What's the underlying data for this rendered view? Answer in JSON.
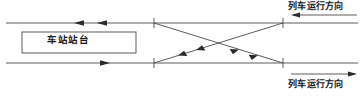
{
  "diagram": {
    "colors": {
      "line": "#4a4a4a",
      "text": "#1a1a1a",
      "background": "#ffffff"
    },
    "platform": {
      "label": "车站站台",
      "box": {
        "x": 22,
        "y": 32,
        "width": 114,
        "height": 21
      }
    },
    "tracks": {
      "top": {
        "y": 23,
        "x1": 6,
        "x2": 358
      },
      "bottom": {
        "y": 63,
        "x1": 6,
        "x2": 358
      }
    },
    "crossover": {
      "left_x": 154,
      "right_x": 283,
      "tick_half_height": 5
    },
    "labels": {
      "direction_top": "列车运行方向",
      "direction_bottom": "列车运行方向"
    },
    "arrows": {
      "direction_top": "arrow-left-icon",
      "direction_bottom": "arrow-right-icon",
      "top_track_1": "arrow-left-icon",
      "top_track_2": "arrow-left-icon",
      "bottom_track_1": "arrow-right-icon",
      "diagonal_descending": "arrow-down-right-icon",
      "diagonal_ascending": "arrow-up-left-icon"
    }
  }
}
